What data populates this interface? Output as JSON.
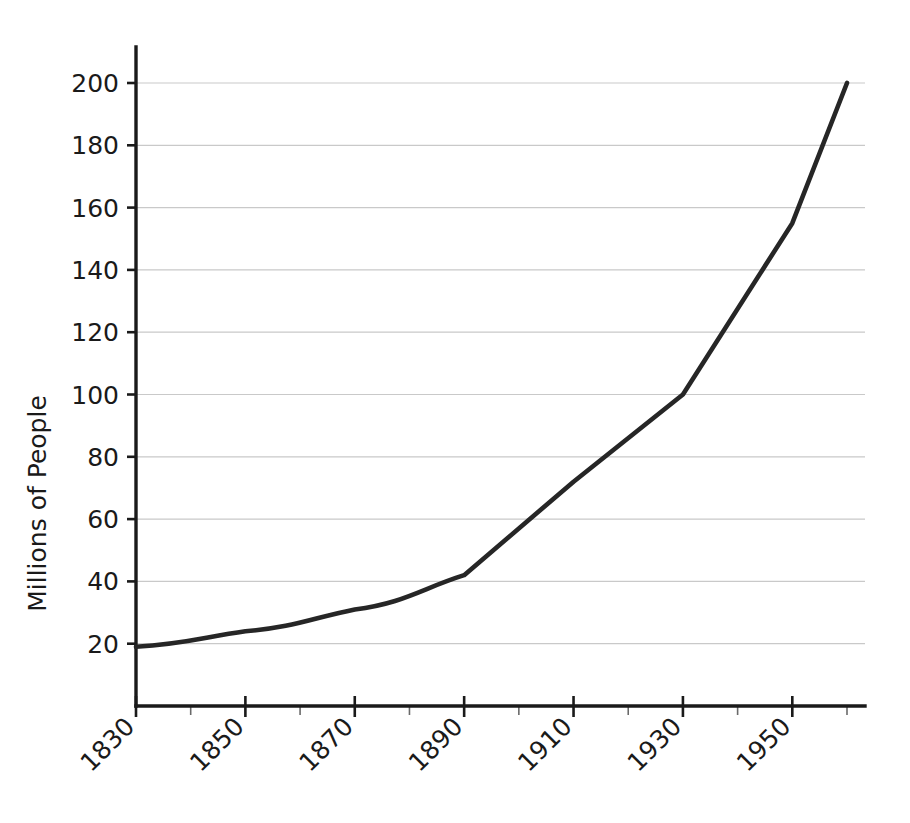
{
  "chart_data": {
    "type": "line",
    "title": "",
    "subtitle": "",
    "xlabel": "",
    "ylabel": "Millions of People",
    "x": [
      1830,
      1850,
      1870,
      1890,
      1910,
      1930,
      1950,
      1960
    ],
    "values": [
      19,
      24,
      31,
      42,
      72,
      100,
      155,
      200
    ],
    "series": [
      {
        "name": "Population",
        "x": [
          1830,
          1850,
          1870,
          1890,
          1910,
          1930,
          1950,
          1960
        ],
        "values": [
          19,
          24,
          31,
          42,
          72,
          100,
          155,
          200
        ]
      }
    ],
    "xlim": [
      1830,
      1960
    ],
    "ylim": [
      0,
      212
    ],
    "x_tick_labels": [
      "1830",
      "1850",
      "1870",
      "1890",
      "1910",
      "1930",
      "1950"
    ],
    "x_tick_values": [
      1830,
      1850,
      1870,
      1890,
      1910,
      1930,
      1950
    ],
    "x_minor_ticks": [
      1840,
      1860,
      1880,
      1900,
      1920,
      1940,
      1960
    ],
    "x_tick_rotation": -45,
    "y_tick_labels": [
      "20",
      "40",
      "60",
      "80",
      "100",
      "120",
      "140",
      "160",
      "180",
      "200"
    ],
    "y_tick_values": [
      20,
      40,
      60,
      80,
      100,
      120,
      140,
      160,
      180,
      200
    ],
    "grid": "horizontal",
    "legend": "none",
    "line_color": "#262626",
    "grid_color": "#c9c9c9",
    "axis_color": "#1a1a1a",
    "background_color": "#ffffff",
    "annotations": []
  }
}
